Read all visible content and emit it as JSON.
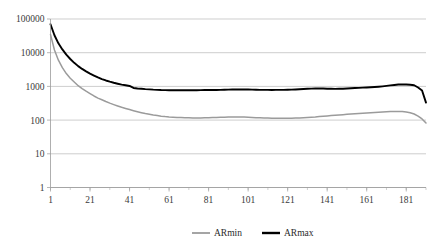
{
  "chart_data": {
    "type": "line",
    "title": "",
    "xlabel": "",
    "ylabel": "",
    "yscale": "log",
    "ylim": [
      1,
      100000
    ],
    "xlim": [
      1,
      191
    ],
    "grid": true,
    "legend_position": "bottom",
    "y_ticks": [
      "100000",
      "10000",
      "1000",
      "100",
      "10",
      "1"
    ],
    "y_tick_values": [
      100000,
      10000,
      1000,
      100,
      10,
      1
    ],
    "x_ticks": [
      "1",
      "21",
      "41",
      "61",
      "81",
      "101",
      "121",
      "141",
      "161",
      "181"
    ],
    "x_tick_values": [
      1,
      21,
      41,
      61,
      81,
      101,
      121,
      141,
      161,
      181
    ],
    "x_minor_step": 10,
    "colors": {
      "ARmin": "#9b9b9b",
      "ARmax": "#000000",
      "grid": "#b9b9b9",
      "axis": "#9a9a9a"
    },
    "series": [
      {
        "name": "ARmin",
        "color": "#9b9b9b",
        "x": [
          1,
          3,
          5,
          7,
          9,
          11,
          13,
          15,
          17,
          19,
          21,
          23,
          25,
          27,
          29,
          31,
          33,
          35,
          37,
          39,
          41,
          43,
          45,
          47,
          49,
          51,
          53,
          55,
          57,
          59,
          61,
          63,
          65,
          67,
          69,
          71,
          73,
          75,
          77,
          79,
          81,
          83,
          85,
          87,
          89,
          91,
          93,
          95,
          97,
          99,
          101,
          103,
          105,
          107,
          109,
          111,
          113,
          115,
          117,
          119,
          121,
          123,
          125,
          127,
          129,
          131,
          133,
          135,
          137,
          139,
          141,
          143,
          145,
          147,
          149,
          151,
          153,
          155,
          157,
          159,
          161,
          163,
          165,
          167,
          169,
          171,
          173,
          175,
          177,
          179,
          181,
          183,
          185,
          187,
          189,
          191
        ],
        "values": [
          35000,
          12000,
          6000,
          3600,
          2400,
          1750,
          1350,
          1050,
          860,
          720,
          610,
          520,
          450,
          400,
          355,
          318,
          288,
          262,
          240,
          222,
          205,
          190,
          177,
          166,
          156,
          148,
          141,
          136,
          131,
          127,
          124,
          122,
          120,
          119,
          118,
          117,
          116,
          116,
          116,
          117,
          118,
          119,
          120,
          121,
          122,
          123,
          124,
          124,
          124,
          123,
          122,
          120,
          118,
          117,
          116,
          115,
          114,
          114,
          113,
          113,
          113,
          114,
          115,
          116,
          118,
          120,
          122,
          124,
          127,
          130,
          133,
          136,
          139,
          142,
          145,
          148,
          151,
          154,
          157,
          160,
          163,
          166,
          169,
          172,
          175,
          178,
          180,
          181,
          181,
          179,
          174,
          166,
          152,
          132,
          108,
          82
        ]
      },
      {
        "name": "ARmax",
        "color": "#000000",
        "x": [
          1,
          3,
          5,
          7,
          9,
          11,
          13,
          15,
          17,
          19,
          21,
          23,
          25,
          27,
          29,
          31,
          33,
          35,
          37,
          39,
          41,
          43,
          45,
          47,
          49,
          51,
          53,
          55,
          57,
          59,
          61,
          63,
          65,
          67,
          69,
          71,
          73,
          75,
          77,
          79,
          81,
          83,
          85,
          87,
          89,
          91,
          93,
          95,
          97,
          99,
          101,
          103,
          105,
          107,
          109,
          111,
          113,
          115,
          117,
          119,
          121,
          123,
          125,
          127,
          129,
          131,
          133,
          135,
          137,
          139,
          141,
          143,
          145,
          147,
          149,
          151,
          153,
          155,
          157,
          159,
          161,
          163,
          165,
          167,
          169,
          171,
          173,
          175,
          177,
          179,
          181,
          183,
          185,
          187,
          189,
          191
        ],
        "values": [
          70000,
          33000,
          19000,
          12500,
          8800,
          6500,
          5000,
          4000,
          3300,
          2800,
          2400,
          2100,
          1850,
          1650,
          1500,
          1380,
          1280,
          1200,
          1130,
          1080,
          1030,
          900,
          870,
          850,
          830,
          815,
          800,
          790,
          780,
          775,
          770,
          768,
          766,
          765,
          766,
          768,
          770,
          772,
          775,
          778,
          780,
          782,
          785,
          790,
          795,
          800,
          805,
          810,
          812,
          810,
          805,
          800,
          795,
          790,
          788,
          786,
          785,
          786,
          788,
          790,
          795,
          800,
          810,
          822,
          835,
          848,
          858,
          865,
          868,
          862,
          855,
          848,
          845,
          848,
          855,
          865,
          878,
          892,
          905,
          918,
          930,
          945,
          960,
          980,
          1005,
          1035,
          1070,
          1105,
          1135,
          1150,
          1140,
          1120,
          1080,
          930,
          760,
          330
        ]
      }
    ],
    "legend": [
      {
        "label": "ARmin",
        "color": "#9b9b9b"
      },
      {
        "label": "ARmax",
        "color": "#000000"
      }
    ]
  },
  "caption": {
    "text": ""
  }
}
